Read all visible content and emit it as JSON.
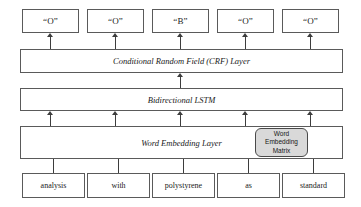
{
  "diagram": {
    "stroke_color": "#5a5a5a",
    "matrix_fill": "#d9d9d9",
    "background": "#ffffff"
  },
  "tags": [
    {
      "label": "“O”"
    },
    {
      "label": "“O”"
    },
    {
      "label": "“B”"
    },
    {
      "label": "“O”"
    },
    {
      "label": "“O”"
    }
  ],
  "layers": {
    "crf": "Conditional Random Field (CRF) Layer",
    "lstm": "Bidirectional LSTM",
    "embedding": "Word Embedding Layer"
  },
  "embedding_matrix": {
    "line1": "Word",
    "line2": "Embedding",
    "line3": "Matrix"
  },
  "tokens": [
    {
      "label": "analysis"
    },
    {
      "label": "with"
    },
    {
      "label": "polystyrene"
    },
    {
      "label": "as"
    },
    {
      "label": "standard"
    }
  ]
}
